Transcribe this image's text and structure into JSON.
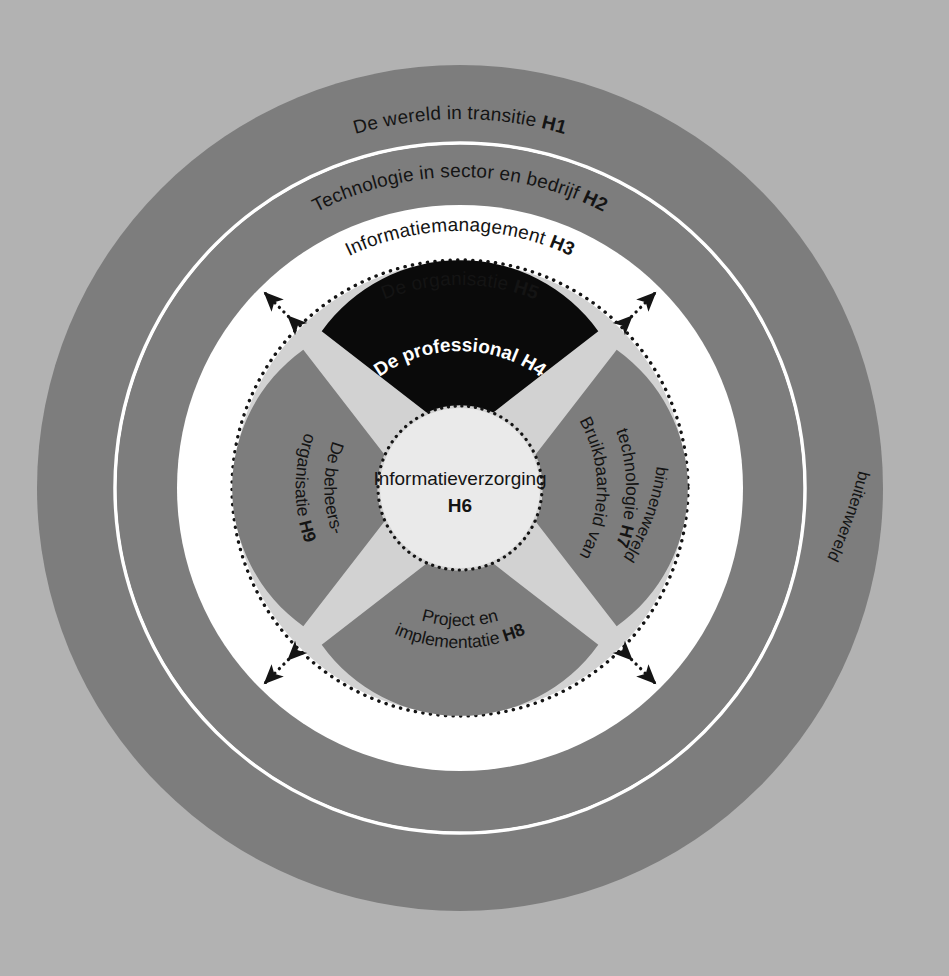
{
  "diagram": {
    "background_color": "#b2b2b2",
    "rings": [
      {
        "id": "h1",
        "label": "De wereld in transitie",
        "chapter": "H1",
        "color": "#7d7d7d",
        "text_color": "#141414"
      },
      {
        "id": "h2",
        "label": "Technologie in sector en bedrijf",
        "chapter": "H2",
        "color": "#7d7d7d",
        "text_color": "#141414"
      },
      {
        "id": "h3",
        "label": "Informatiemanagement",
        "chapter": "H3",
        "color": "#ffffff",
        "text_color": "#141414"
      },
      {
        "id": "h5",
        "label": "De organisatie",
        "chapter": "H5",
        "color": "#d2d2d2",
        "text_color": "#141414"
      }
    ],
    "wedges": [
      {
        "id": "h4",
        "label_lines": [
          "De professional"
        ],
        "chapter": "H4",
        "color": "#0a0a0a",
        "text_color": "#ffffff",
        "position": "top"
      },
      {
        "id": "h7",
        "label_lines": [
          "Bruikbaarheid van",
          "technologie"
        ],
        "chapter": "H7",
        "color": "#7d7d7d",
        "text_color": "#141414",
        "position": "right"
      },
      {
        "id": "h8",
        "label_lines": [
          "Project en",
          "implementatie"
        ],
        "chapter": "H8",
        "color": "#7d7d7d",
        "text_color": "#141414",
        "position": "bottom"
      },
      {
        "id": "h9",
        "label_lines": [
          "De beheers-",
          "organisatie"
        ],
        "chapter": "H9",
        "color": "#7d7d7d",
        "text_color": "#141414",
        "position": "left"
      }
    ],
    "center": {
      "id": "h6",
      "label": "Informatieverzorging",
      "chapter": "H6",
      "color": "#eaeaea",
      "text_color": "#141414"
    },
    "world_labels": {
      "outer": "buitenwereld",
      "inner": "binnenwereld"
    },
    "arrows": {
      "count": 4,
      "style": "dotted-double-headed",
      "color": "#141414"
    }
  }
}
